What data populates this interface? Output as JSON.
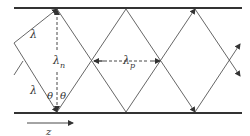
{
  "diagram": {
    "labels": {
      "lambda_upper": "λ",
      "lambda_lower": "λ",
      "lambda_n": "λ",
      "lambda_n_sub": "n",
      "lambda_p": "λ",
      "lambda_p_sub": "p",
      "theta_left": "θ",
      "theta_right": "θ",
      "z_axis": "z"
    },
    "colors": {
      "wall": "#333333",
      "ray": "#555555",
      "text": "#333333"
    }
  }
}
